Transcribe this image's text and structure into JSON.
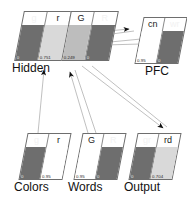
{
  "diagram": {
    "palette": {
      "active": "#6e6e6e",
      "inactive": "#ffffff",
      "mid": "#bdbdbd",
      "light": "#d9d9d9",
      "stroke": "#6e6e6e",
      "wire": "#b5b5b5",
      "arrow": "#111111",
      "text": "#111111"
    },
    "layers": [
      {
        "id": "hidden",
        "label": "Hidden",
        "groups": [
          {
            "id": "hidden-a",
            "cells": [
              {
                "name": "g",
                "value": "0",
                "fill": "#6e6e6e",
                "on": true
              },
              {
                "name": "r",
                "value": "0.751",
                "fill": "#d9d9d9",
                "on": false
              }
            ]
          },
          {
            "id": "hidden-b",
            "cells": [
              {
                "name": "G",
                "value": "0.249",
                "fill": "#bdbdbd",
                "on": false
              },
              {
                "name": "R",
                "value": "0",
                "fill": "#6e6e6e",
                "on": true
              }
            ]
          }
        ]
      },
      {
        "id": "pfc",
        "label": "PFC",
        "groups": [
          {
            "id": "pfc-a",
            "cells": [
              {
                "name": "cn",
                "value": "0.95",
                "fill": "#ffffff",
                "on": false
              },
              {
                "name": "wr",
                "value": "0",
                "fill": "#6e6e6e",
                "on": true
              }
            ]
          }
        ]
      },
      {
        "id": "colors",
        "label": "Colors",
        "groups": [
          {
            "id": "colors-a",
            "cells": [
              {
                "name": "g",
                "value": "0",
                "fill": "#6e6e6e",
                "on": true
              },
              {
                "name": "r",
                "value": "0.95",
                "fill": "#ffffff",
                "on": false
              }
            ]
          }
        ]
      },
      {
        "id": "words",
        "label": "Words",
        "groups": [
          {
            "id": "words-a",
            "cells": [
              {
                "name": "G",
                "value": "0.95",
                "fill": "#ffffff",
                "on": false
              },
              {
                "name": "R",
                "value": "0",
                "fill": "#6e6e6e",
                "on": true
              }
            ]
          }
        ]
      },
      {
        "id": "output",
        "label": "Output",
        "groups": [
          {
            "id": "output-a",
            "cells": [
              {
                "name": "gr",
                "value": "0",
                "fill": "#6e6e6e",
                "on": true
              },
              {
                "name": "rd",
                "value": "0.704",
                "fill": "#d9d9d9",
                "on": false
              }
            ]
          }
        ]
      }
    ],
    "connections": [
      {
        "from": "pfc",
        "to": "hidden",
        "kind": "arrow"
      },
      {
        "from": "hidden",
        "to": "pfc",
        "kind": "arrow"
      },
      {
        "from": "colors",
        "to": "hidden",
        "kind": "arrow"
      },
      {
        "from": "words",
        "to": "hidden",
        "kind": "arrow"
      },
      {
        "from": "hidden",
        "to": "output",
        "kind": "arrow"
      }
    ]
  }
}
